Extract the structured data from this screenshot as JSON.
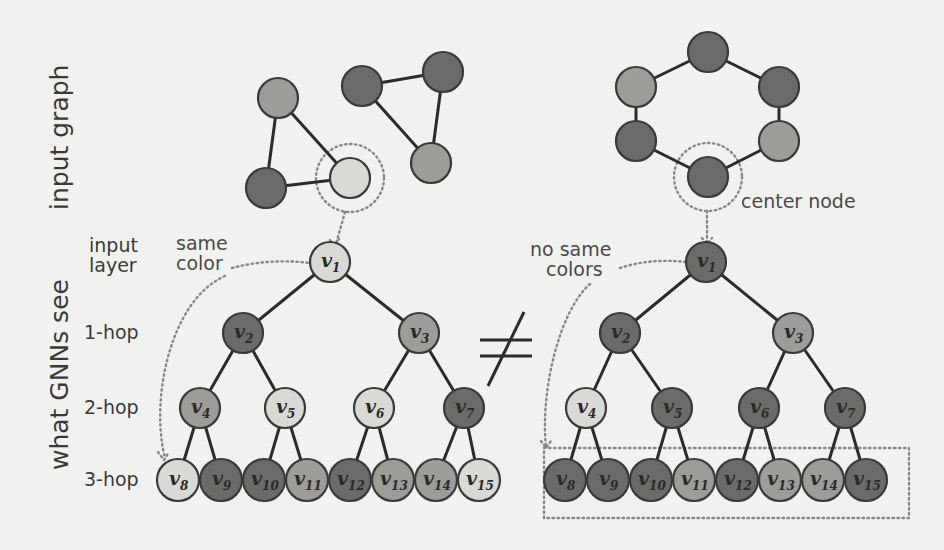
{
  "colors": {
    "light": "#d9d9d6",
    "medium": "#9c9c99",
    "dark": "#6b6b69",
    "background": "#f1f1ef"
  },
  "labels": {
    "input_graph": "input graph",
    "what_gnns_see": "what GNNs see",
    "input_layer_line1": "input",
    "input_layer_line2": "layer",
    "hop1": "1-hop",
    "hop2": "2-hop",
    "hop3": "3-hop",
    "same_color_line1": "same",
    "same_color_line2": "color",
    "no_same_colors_line1": "no same",
    "no_same_colors_line2": "colors",
    "center_node": "center node",
    "not_equal": "≠"
  },
  "input_graphs": {
    "left": {
      "nodes": [
        {
          "id": "a",
          "x": 278,
          "y": 98,
          "color": "medium"
        },
        {
          "id": "b",
          "x": 266,
          "y": 188,
          "color": "dark"
        },
        {
          "id": "c",
          "x": 350,
          "y": 178,
          "color": "light",
          "center": true
        },
        {
          "id": "d",
          "x": 362,
          "y": 86,
          "color": "dark"
        },
        {
          "id": "e",
          "x": 443,
          "y": 72,
          "color": "dark"
        },
        {
          "id": "f",
          "x": 431,
          "y": 163,
          "color": "medium"
        }
      ],
      "edges": [
        [
          "a",
          "b"
        ],
        [
          "a",
          "c"
        ],
        [
          "b",
          "c"
        ],
        [
          "d",
          "e"
        ],
        [
          "d",
          "f"
        ],
        [
          "e",
          "f"
        ]
      ]
    },
    "right": {
      "nodes": [
        {
          "id": "h1",
          "x": 708,
          "y": 52,
          "color": "dark"
        },
        {
          "id": "h2",
          "x": 779,
          "y": 87,
          "color": "dark"
        },
        {
          "id": "h3",
          "x": 779,
          "y": 141,
          "color": "medium"
        },
        {
          "id": "h4",
          "x": 708,
          "y": 177,
          "color": "dark",
          "center": true
        },
        {
          "id": "h5",
          "x": 636,
          "y": 141,
          "color": "dark"
        },
        {
          "id": "h6",
          "x": 636,
          "y": 87,
          "color": "medium"
        }
      ],
      "edges": [
        [
          "h1",
          "h2"
        ],
        [
          "h2",
          "h3"
        ],
        [
          "h3",
          "h4"
        ],
        [
          "h4",
          "h5"
        ],
        [
          "h5",
          "h6"
        ],
        [
          "h6",
          "h1"
        ]
      ]
    }
  },
  "trees": {
    "left": {
      "nodes": [
        {
          "label": "v",
          "sub": "1",
          "x": 330,
          "y": 262,
          "color": "light"
        },
        {
          "label": "v",
          "sub": "2",
          "x": 243,
          "y": 333,
          "color": "dark"
        },
        {
          "label": "v",
          "sub": "3",
          "x": 419,
          "y": 333,
          "color": "medium"
        },
        {
          "label": "v",
          "sub": "4",
          "x": 200,
          "y": 408,
          "color": "medium"
        },
        {
          "label": "v",
          "sub": "5",
          "x": 285,
          "y": 408,
          "color": "light"
        },
        {
          "label": "v",
          "sub": "6",
          "x": 374,
          "y": 408,
          "color": "light"
        },
        {
          "label": "v",
          "sub": "7",
          "x": 464,
          "y": 408,
          "color": "dark"
        },
        {
          "label": "v",
          "sub": "8",
          "x": 178,
          "y": 480,
          "color": "light"
        },
        {
          "label": "v",
          "sub": "9",
          "x": 221,
          "y": 480,
          "color": "dark"
        },
        {
          "label": "v",
          "sub": "10",
          "x": 264,
          "y": 480,
          "color": "dark"
        },
        {
          "label": "v",
          "sub": "11",
          "x": 307,
          "y": 480,
          "color": "medium"
        },
        {
          "label": "v",
          "sub": "12",
          "x": 350,
          "y": 480,
          "color": "dark"
        },
        {
          "label": "v",
          "sub": "13",
          "x": 393,
          "y": 480,
          "color": "medium"
        },
        {
          "label": "v",
          "sub": "14",
          "x": 436,
          "y": 480,
          "color": "medium"
        },
        {
          "label": "v",
          "sub": "15",
          "x": 479,
          "y": 480,
          "color": "light"
        }
      ]
    },
    "right": {
      "nodes": [
        {
          "label": "v",
          "sub": "1",
          "x": 706,
          "y": 262,
          "color": "dark"
        },
        {
          "label": "v",
          "sub": "2",
          "x": 620,
          "y": 333,
          "color": "dark"
        },
        {
          "label": "v",
          "sub": "3",
          "x": 793,
          "y": 333,
          "color": "medium"
        },
        {
          "label": "v",
          "sub": "4",
          "x": 586,
          "y": 408,
          "color": "light"
        },
        {
          "label": "v",
          "sub": "5",
          "x": 672,
          "y": 408,
          "color": "dark"
        },
        {
          "label": "v",
          "sub": "6",
          "x": 759,
          "y": 408,
          "color": "dark"
        },
        {
          "label": "v",
          "sub": "7",
          "x": 845,
          "y": 408,
          "color": "dark"
        },
        {
          "label": "v",
          "sub": "8",
          "x": 565,
          "y": 480,
          "color": "dark"
        },
        {
          "label": "v",
          "sub": "9",
          "x": 608,
          "y": 480,
          "color": "dark"
        },
        {
          "label": "v",
          "sub": "10",
          "x": 651,
          "y": 480,
          "color": "dark"
        },
        {
          "label": "v",
          "sub": "11",
          "x": 694,
          "y": 480,
          "color": "medium"
        },
        {
          "label": "v",
          "sub": "12",
          "x": 737,
          "y": 480,
          "color": "dark"
        },
        {
          "label": "v",
          "sub": "13",
          "x": 780,
          "y": 480,
          "color": "medium"
        },
        {
          "label": "v",
          "sub": "14",
          "x": 823,
          "y": 480,
          "color": "medium"
        },
        {
          "label": "v",
          "sub": "15",
          "x": 866,
          "y": 480,
          "color": "dark"
        }
      ]
    }
  }
}
